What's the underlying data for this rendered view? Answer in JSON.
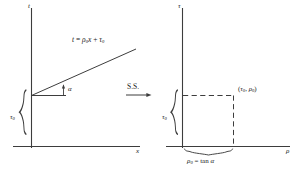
{
  "figure": {
    "background_color": "#ffffff",
    "line_color": "#3a3a3a",
    "text_color": "#222222"
  },
  "left_panel": {
    "name": "x-t space",
    "y_axis_label": "t",
    "x_axis_label": "x",
    "line_equation": "t = ρ₀x + τ₀",
    "equation_parts": {
      "lhs": "t",
      "equals": "=",
      "slope_symbol": "ρ",
      "slope_sub": "0",
      "variable": "x",
      "plus": "+",
      "intercept_symbol": "τ",
      "intercept_sub": "0"
    },
    "angle_label": "α",
    "intercept_brace_label": "τ",
    "intercept_brace_sub": "0"
  },
  "transform": {
    "label": "S.S.",
    "arrow": "right-arrow",
    "meaning": "slant stack"
  },
  "right_panel": {
    "name": "rho-tau space",
    "y_axis_label": "τ",
    "x_axis_label": "ρ",
    "point_label_open": "(",
    "point_label_tau": "τ",
    "point_label_tau_sub": "0",
    "point_label_comma": ",",
    "point_label_rho": "ρ",
    "point_label_rho_sub": "0",
    "point_label_close": ")",
    "point_label": "(τ₀, ρ₀)",
    "tau_brace_label": "τ",
    "tau_brace_sub": "0",
    "rho_brace_equation": "ρ₀ = tan α",
    "rho_brace_parts": {
      "symbol": "ρ",
      "sub": "0",
      "equals": "=",
      "func": "tan",
      "angle": "α"
    }
  }
}
